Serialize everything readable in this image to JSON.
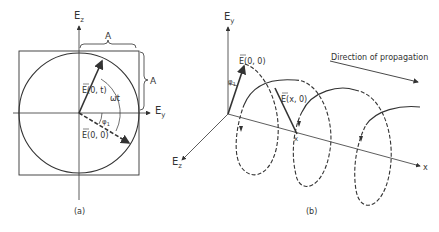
{
  "panel_a": {
    "caption": "(a)",
    "axis_vertical": "E",
    "axis_vertical_sub": "z",
    "axis_horizontal": "E",
    "axis_horizontal_sub": "y",
    "amplitude_top": "A",
    "amplitude_right": "A",
    "vector_t": "E(0, t)",
    "vector_0": "E(0, 0)",
    "angle_wt": "ωt",
    "angle_phi": "φ",
    "angle_phi_sub": "1"
  },
  "panel_b": {
    "caption": "(b)",
    "axis_vertical": "E",
    "axis_vertical_sub": "y",
    "axis_depth": "E",
    "axis_depth_sub": "z",
    "axis_x": "x",
    "vector_00": "E(0, 0)",
    "vector_x0": "E(x, 0)",
    "point_x": "x",
    "angle_phi": "φ",
    "angle_phi_sub": "1",
    "propagation_label": "Direction of propagation"
  },
  "colors": {
    "ink": "#333333",
    "background": "#ffffff"
  }
}
